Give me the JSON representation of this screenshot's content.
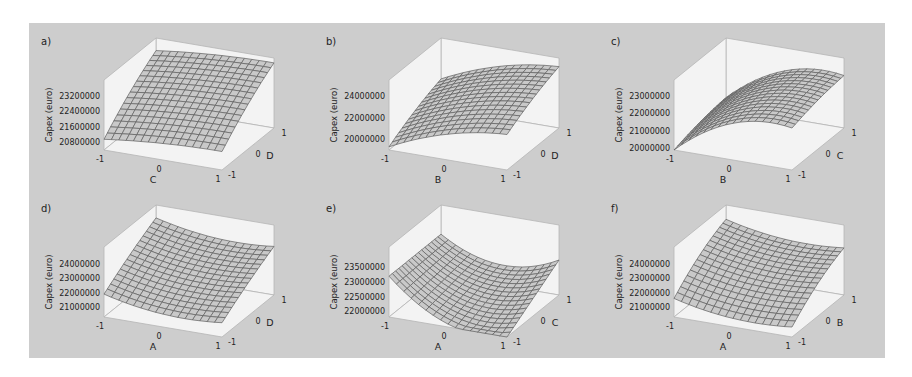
{
  "chart_data": [
    {
      "id": "a",
      "panel_label": "a)",
      "type": "surface3d",
      "zlabel": "Capex (euro)",
      "xlabel": "C",
      "ylabel": "D",
      "x_ticks": [
        "-1",
        "0",
        "1"
      ],
      "y_ticks": [
        "-1",
        "0",
        "1"
      ],
      "z_ticks": [
        "20800000",
        "21600000",
        "22400000",
        "23200000"
      ],
      "zlim": [
        20400000,
        24000000
      ],
      "surface": {
        "c0": 22600000,
        "cx": 200000,
        "cy": 1200000,
        "cxx": -100000,
        "cyy": -150000,
        "cxy": 0
      },
      "origin": [
        29,
        23
      ]
    },
    {
      "id": "b",
      "panel_label": "b)",
      "type": "surface3d",
      "zlabel": "Capex (euro)",
      "xlabel": "B",
      "ylabel": "D",
      "x_ticks": [
        "-1",
        "0",
        "1"
      ],
      "y_ticks": [
        "-1",
        "0",
        "1"
      ],
      "z_ticks": [
        "20000000",
        "22000000",
        "24000000"
      ],
      "zlim": [
        19000000,
        25500000
      ],
      "surface": {
        "c0": 22800000,
        "cx": 1500000,
        "cy": 1200000,
        "cxx": -600000,
        "cyy": -200000,
        "cxy": 0
      },
      "origin": [
        314,
        23
      ]
    },
    {
      "id": "c",
      "panel_label": "c)",
      "type": "surface3d",
      "zlabel": "Capex (euro)",
      "xlabel": "B",
      "ylabel": "C",
      "x_ticks": [
        "-1",
        "0",
        "1"
      ],
      "y_ticks": [
        "-1",
        "0",
        "1"
      ],
      "z_ticks": [
        "20000000",
        "21000000",
        "22000000",
        "23000000"
      ],
      "zlim": [
        19900000,
        23900000
      ],
      "surface": {
        "c0": 22400000,
        "cx": 1200000,
        "cy": 300000,
        "cxx": -900000,
        "cyy": -100000,
        "cxy": 0
      },
      "origin": [
        599,
        23
      ]
    },
    {
      "id": "d",
      "panel_label": "d)",
      "type": "surface3d",
      "zlabel": "Capex (euro)",
      "xlabel": "A",
      "ylabel": "D",
      "x_ticks": [
        "-1",
        "0",
        "1"
      ],
      "y_ticks": [
        "-1",
        "0",
        "1"
      ],
      "z_ticks": [
        "21000000",
        "22000000",
        "23000000",
        "24000000"
      ],
      "zlim": [
        20300000,
        25200000
      ],
      "surface": {
        "c0": 22500000,
        "cx": -300000,
        "cy": 1200000,
        "cxx": 400000,
        "cyy": -100000,
        "cxy": 0
      },
      "origin": [
        29,
        190
      ]
    },
    {
      "id": "e",
      "panel_label": "e)",
      "type": "surface3d",
      "zlabel": "Capex (euro)",
      "xlabel": "A",
      "ylabel": "C",
      "x_ticks": [
        "-1",
        "0",
        "1"
      ],
      "y_ticks": [
        "-1",
        "0",
        "1"
      ],
      "z_ticks": [
        "22000000",
        "22500000",
        "23000000",
        "23500000"
      ],
      "zlim": [
        21800000,
        24200000
      ],
      "surface": {
        "c0": 22200000,
        "cx": -400000,
        "cy": 300000,
        "cxx": 600000,
        "cyy": 0,
        "cxy": 300000
      },
      "origin": [
        314,
        190
      ]
    },
    {
      "id": "f",
      "panel_label": "f)",
      "type": "surface3d",
      "zlabel": "Capex (euro)",
      "xlabel": "A",
      "ylabel": "B",
      "x_ticks": [
        "-1",
        "0",
        "1"
      ],
      "y_ticks": [
        "-1",
        "0",
        "1"
      ],
      "z_ticks": [
        "21000000",
        "22000000",
        "23000000",
        "24000000"
      ],
      "zlim": [
        20300000,
        25200000
      ],
      "surface": {
        "c0": 22500000,
        "cx": -300000,
        "cy": 1300000,
        "cxx": 400000,
        "cyy": -300000,
        "cxy": 0
      },
      "origin": [
        599,
        190
      ]
    }
  ],
  "colors": {
    "figure_bg": "#cdcdcd",
    "box_face": "#f3f3f3",
    "box_edge": "#b5b5b5",
    "surface_fill": "#c9c9c9",
    "surface_grid": "#5e5e5e"
  },
  "grid_n": 16
}
